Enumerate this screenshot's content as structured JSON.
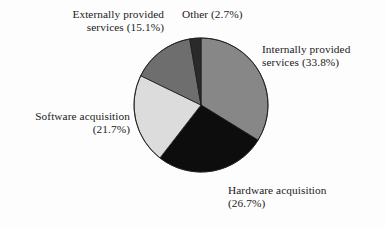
{
  "figure": {
    "name": "it-spending-breakdown-pie-chart",
    "background_color": "#fdfdfd"
  },
  "chart_data": {
    "type": "pie",
    "title": "",
    "subtitle": "",
    "xlabel": "",
    "ylabel": "",
    "legend_position": "none",
    "grid": false,
    "labels_inline": true,
    "units": "percent",
    "total": 100.0,
    "start_angle_deg": 0,
    "direction": "clockwise",
    "center": {
      "x": 201,
      "y": 105
    },
    "radius": 67,
    "categories": [
      "Internally provided services",
      "Hardware acquisition",
      "Software acquisition",
      "Externally provided services",
      "Other"
    ],
    "values": [
      33.8,
      26.7,
      21.7,
      15.1,
      2.7
    ],
    "colors": [
      "#878787",
      "#0d0d0d",
      "#dcdcdc",
      "#6e6e6e",
      "#2a2a2a"
    ],
    "slices": [
      {
        "name": "Internally provided services",
        "value": 33.8,
        "color": "#878787",
        "start_angle_deg": 0.0,
        "end_angle_deg": 121.68,
        "label_line1": "Internally provided",
        "label_line2": "services (33.8%)",
        "label_text": "Internally provided\nservices (33.8%)"
      },
      {
        "name": "Hardware acquisition",
        "value": 26.7,
        "color": "#0d0d0d",
        "start_angle_deg": 121.68,
        "end_angle_deg": 217.8,
        "label_line1": "Hardware acquisition",
        "label_line2": "(26.7%)",
        "label_text": "Hardware acquisition\n(26.7%)"
      },
      {
        "name": "Software acquisition",
        "value": 21.7,
        "color": "#dcdcdc",
        "start_angle_deg": 217.8,
        "end_angle_deg": 295.92,
        "label_line1": "Software acquisition",
        "label_line2": "(21.7%)",
        "label_text": "Software acquisition\n(21.7%)"
      },
      {
        "name": "Externally provided services",
        "value": 15.1,
        "color": "#6e6e6e",
        "start_angle_deg": 295.92,
        "end_angle_deg": 350.28,
        "label_line1": "Externally provided",
        "label_line2": "services (15.1%)",
        "label_text": "Externally provided\nservices (15.1%)"
      },
      {
        "name": "Other",
        "value": 2.7,
        "color": "#2a2a2a",
        "start_angle_deg": 350.28,
        "end_angle_deg": 360.0,
        "label_line1": "Other (2.7%)",
        "label_line2": "",
        "label_text": "Other (2.7%)"
      }
    ],
    "outline_color": "#1b1b1b",
    "outline_width": 0.8
  }
}
